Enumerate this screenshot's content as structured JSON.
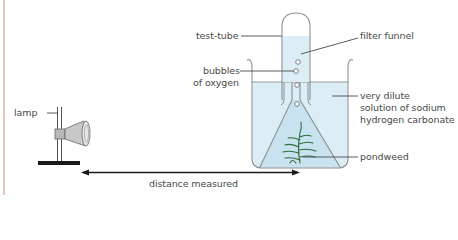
{
  "figure": {
    "labels": {
      "test_tube": "test-tube",
      "filter_funnel": "filter funnel",
      "bubbles_line1": "bubbles",
      "bubbles_line2": "of oxygen",
      "solution_line1": "very dilute",
      "solution_line2": "solution of sodium",
      "solution_line3": "hydrogen carbonate",
      "pondweed": "pondweed",
      "lamp": "lamp",
      "distance": "distance measured"
    },
    "colors": {
      "border": "#e8c7b6",
      "water": "#dcedf5",
      "water_deep": "#c9e2f0",
      "glass_outline": "#8a8f94",
      "leader_line": "#4a4a4a",
      "pondweed": "#2f6b3a",
      "arrow": "#1a1a1a",
      "lamp_base": "#1a1a1a"
    },
    "components": [
      "lamp",
      "stand",
      "beaker",
      "test-tube",
      "filter funnel",
      "pondweed",
      "oxygen bubbles",
      "distance arrow"
    ]
  }
}
